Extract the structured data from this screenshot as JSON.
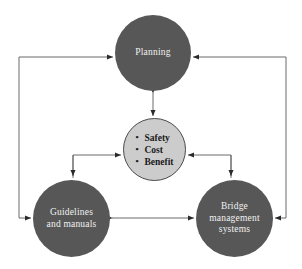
{
  "diagram": {
    "type": "cycle-flow-diagram",
    "background_color": "#ffffff",
    "node_fill_dark": "#575757",
    "node_fill_light": "#cccccc",
    "node_text_light": "#f2f2f2",
    "node_text_dark": "#1a1a1a",
    "connector_color": "#4d4d4d",
    "nodes": {
      "planning": {
        "label": "Planning",
        "shape": "circle",
        "fill": "dark"
      },
      "guidelines": {
        "label": "Guidelines\nand manuals",
        "shape": "circle",
        "fill": "dark"
      },
      "bridge_management_systems": {
        "label": "Bridge\nmanagement\nsystems",
        "shape": "circle",
        "fill": "dark"
      },
      "criteria": {
        "shape": "circle",
        "fill": "light",
        "items": [
          "Safety",
          "Cost",
          "Benefit"
        ]
      }
    },
    "connectors": [
      {
        "name": "planning-criteria",
        "from": "planning",
        "to": "criteria",
        "style": "double-arrow-vertical"
      },
      {
        "name": "guidelines-bms",
        "from": "guidelines",
        "to": "bridge_management_systems",
        "style": "double-arrow-horizontal"
      },
      {
        "name": "guidelines-criteria-elbow",
        "from": "guidelines",
        "to": "criteria",
        "style": "elbow-double-arrow"
      },
      {
        "name": "bms-criteria-elbow",
        "from": "bridge_management_systems",
        "to": "criteria",
        "style": "elbow-double-arrow"
      },
      {
        "name": "guidelines-to-planning-outer-left",
        "from": "guidelines",
        "to": "planning",
        "style": "outer-loop-left"
      },
      {
        "name": "bms-to-planning-outer-right",
        "from": "bridge_management_systems",
        "to": "planning",
        "style": "outer-loop-right"
      }
    ]
  }
}
